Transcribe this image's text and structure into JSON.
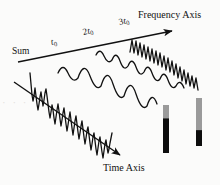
{
  "figure": {
    "background_color": "#fbfbfa",
    "ink_color": "#111111",
    "width": 220,
    "height": 185
  },
  "axes": {
    "frequency": {
      "label": "Frequency Axis",
      "direction": "up-right",
      "arrow_start": [
        18,
        62
      ],
      "arrow_end": [
        174,
        30
      ]
    },
    "time": {
      "label": "Time Axis",
      "direction": "down-right",
      "arrow_start": [
        14,
        82
      ],
      "arrow_end": [
        122,
        157
      ]
    }
  },
  "harmonic_labels": [
    {
      "name": "sum",
      "text": "Sum",
      "coefficient": "",
      "symbol": "t",
      "subscript": ""
    },
    {
      "name": "h1",
      "coefficient": "",
      "symbol": "t",
      "subscript": "0"
    },
    {
      "name": "h2",
      "coefficient": "2",
      "symbol": "t",
      "subscript": "0"
    },
    {
      "name": "h3",
      "coefficient": "3",
      "symbol": "t",
      "subscript": "0"
    }
  ],
  "waveforms": [
    {
      "name": "sum-trace",
      "role": "composite sum signal",
      "stroke": "#111111",
      "stroke_width": 1.3,
      "path": "M 30,73 L 31,84 L 32,95 L 33,101 L 34,96 L 35,88 L 36,96 L 37,104 L 38,110 L 39,104 L 40,97 L 41,92 L 42,99 L 43,106 L 44,100 L 45,93 L 46,89 L 47,96 L 48,104 L 49,112 L 50,118 L 51,112 L 52,105 L 53,110 L 54,118 L 55,124 L 56,117 L 57,110 L 58,104 L 59,111 L 60,119 L 61,126 L 62,120 L 63,113 L 64,108 L 65,116 L 66,124 L 67,131 L 68,125 L 69,118 L 70,112 L 71,120 L 72,128 L 73,135 L 74,128 L 75,121 L 76,116 L 77,124 L 78,132 L 79,139 L 80,133 L 81,126 L 82,121 L 83,129 L 84,137 L 85,144 L 86,138 L 87,131 L 88,127 L 89,135 L 90,143 L 91,150 L 92,144 L 93,137 L 94,133 L 95,141 L 96,149 L 97,155 L 98,148 L 99,141 L 100,137 L 101,145 L 102,152 L 103,158 L 104,151 L 105,144 L 106,140 L 107,147 L 108,153 L 109,149 L 110,143 L 111,138 L 112,133"
    },
    {
      "name": "h1-trace",
      "role": "fundamental component t0",
      "stroke": "#111111",
      "stroke_width": 1.3,
      "path": "M 58,73 Q 63,62 68,73 T 78,78 Q 84,60 90,76 T 101,86 Q 107,66 113,84 T 124,96 Q 130,76 136,94 T 147,106 Q 152,90 157,104"
    },
    {
      "name": "h2-trace",
      "role": "second harmonic 2t0",
      "stroke": "#111111",
      "stroke_width": 1.3,
      "path": "M 96,55 Q 100,47 104,56 T 112,60 Q 116,50 120,61 T 128,66 Q 132,56 136,67 T 144,72 Q 148,62 152,73 T 160,79 Q 164,69 168,80 T 176,86 Q 180,78 184,88"
    },
    {
      "name": "h3-trace",
      "role": "third harmonic 3t0",
      "stroke": "#111111",
      "stroke_width": 1.3,
      "path": "M 130,52 L 132,40 L 134,53 L 136,41 L 138,55 L 140,43 L 142,57 L 144,45 L 146,59 L 148,47 L 150,61 L 152,49 L 154,63 L 156,51 L 158,65 L 160,53 L 162,67 L 164,56 L 166,70 L 168,58 L 170,72 L 172,61 L 174,75 L 176,64 L 178,78 L 180,67 L 182,81 L 184,70 L 186,84 L 188,73 L 190,86 L 192,76 L 194,88 L 196,78 L 198,90"
    }
  ],
  "level_bars": [
    {
      "name": "level-bar-1",
      "x": 163,
      "y": 105,
      "width": 6,
      "height": 48,
      "gray_color": "#9a9a9a",
      "fill_color": "#0d0d0d",
      "fill_fraction": 0.72
    },
    {
      "name": "level-bar-2",
      "x": 196,
      "y": 98,
      "width": 6,
      "height": 48,
      "gray_color": "#9a9a9a",
      "fill_color": "#0d0d0d",
      "fill_fraction": 0.33
    }
  ],
  "artifacts": {
    "left_smudge": "· · ·"
  }
}
